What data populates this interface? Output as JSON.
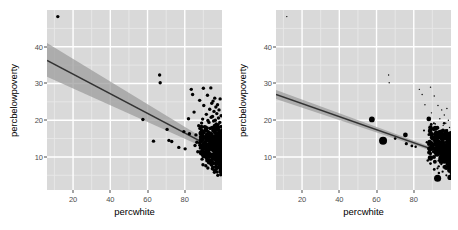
{
  "figure": {
    "type": "faceted-scatter",
    "panel_bg": "#d9d9d9",
    "grid_major_color": "#ffffff",
    "grid_minor_color": "#e8e8e8",
    "point_color": "#000000",
    "line_color": "#333333",
    "ribbon_color": "#9a9a9a"
  },
  "panels": {
    "left": {
      "xlabel": "percwhite",
      "ylabel": "percbelowpoverty",
      "xticks": [
        20,
        40,
        60,
        80
      ],
      "yticks": [
        10,
        20,
        30,
        40
      ]
    },
    "right": {
      "xlabel": "percwhite",
      "ylabel": "percbelowpoverty",
      "xticks": [
        20,
        40,
        60,
        80
      ],
      "yticks": [
        10,
        20,
        30,
        40
      ]
    }
  },
  "legend": {
    "title": "popdensity",
    "entries": [
      {
        "label": "20000",
        "size": 3.2
      },
      {
        "label": "40000",
        "size": 4.6
      },
      {
        "label": "60000",
        "size": 6.2
      },
      {
        "label": "80000",
        "size": 8.0
      }
    ]
  },
  "chart_data": {
    "type": "scatter",
    "title": "",
    "xlabel": "percwhite",
    "ylabel": "percbelowpoverty",
    "xlim": [
      6,
      100
    ],
    "ylim": [
      1,
      50
    ],
    "xticks": [
      20,
      40,
      60,
      80
    ],
    "yticks": [
      10,
      20,
      30,
      40
    ],
    "grid": true,
    "legend": {
      "position": "right",
      "title": "popdensity",
      "values": [
        20000,
        40000,
        60000,
        80000
      ]
    },
    "panels": [
      {
        "name": "left",
        "size_mapping": false,
        "fit": {
          "type": "linear",
          "x0": 6,
          "y0": 36.3,
          "x1": 100,
          "y1": 11.2,
          "band_lo0": 31.8,
          "band_hi0": 41.0,
          "band_lo1": 10.4,
          "band_hi1": 12.0
        },
        "points": [
          [
            11.8,
            48.2
          ],
          [
            57.5,
            20.2
          ],
          [
            66.5,
            32.3
          ],
          [
            66.8,
            30.2
          ],
          [
            63.2,
            14.3
          ],
          [
            70.5,
            17.5
          ],
          [
            71.5,
            14.5
          ],
          [
            73.0,
            14.2
          ],
          [
            76.8,
            12.6
          ],
          [
            79.5,
            16.9
          ],
          [
            80.2,
            12.2
          ],
          [
            82.0,
            20.4
          ],
          [
            82.5,
            16.3
          ],
          [
            83.5,
            28.4
          ],
          [
            84.2,
            27.0
          ],
          [
            85.0,
            22.2
          ],
          [
            85.5,
            13.1
          ],
          [
            86.0,
            16.0
          ],
          [
            86.5,
            14.0
          ],
          [
            87.0,
            11.4
          ],
          [
            87.5,
            18.5
          ],
          [
            88.0,
            25.4
          ],
          [
            88.5,
            15.2
          ],
          [
            89.0,
            12.9
          ],
          [
            89.3,
            9.4
          ],
          [
            89.6,
            20.3
          ],
          [
            90.0,
            28.7
          ],
          [
            90.2,
            24.0
          ],
          [
            90.6,
            18.2
          ],
          [
            90.8,
            13.7
          ],
          [
            91.0,
            10.1
          ],
          [
            91.3,
            7.6
          ],
          [
            91.6,
            21.6
          ],
          [
            91.9,
            17.0
          ],
          [
            92.0,
            12.4
          ],
          [
            92.2,
            26.8
          ],
          [
            92.4,
            15.0
          ],
          [
            92.6,
            11.0
          ],
          [
            92.8,
            8.4
          ],
          [
            93.0,
            19.4
          ],
          [
            93.2,
            14.6
          ],
          [
            93.4,
            23.0
          ],
          [
            93.6,
            10.4
          ],
          [
            93.8,
            17.8
          ],
          [
            94.0,
            28.8
          ],
          [
            94.1,
            13.2
          ],
          [
            94.2,
            20.8
          ],
          [
            94.3,
            9.0
          ],
          [
            94.4,
            16.2
          ],
          [
            94.5,
            24.6
          ],
          [
            94.6,
            12.0
          ],
          [
            94.7,
            18.0
          ],
          [
            94.8,
            6.8
          ],
          [
            94.9,
            21.0
          ],
          [
            95.0,
            14.2
          ],
          [
            95.1,
            10.8
          ],
          [
            95.2,
            25.2
          ],
          [
            95.3,
            17.4
          ],
          [
            95.4,
            13.0
          ],
          [
            95.5,
            19.8
          ],
          [
            95.6,
            8.2
          ],
          [
            95.7,
            22.4
          ],
          [
            95.8,
            15.6
          ],
          [
            95.9,
            11.6
          ],
          [
            96.0,
            18.6
          ],
          [
            96.1,
            26.0
          ],
          [
            96.2,
            9.8
          ],
          [
            96.3,
            14.8
          ],
          [
            96.4,
            20.0
          ],
          [
            96.5,
            12.2
          ],
          [
            96.6,
            16.6
          ],
          [
            96.7,
            23.6
          ],
          [
            96.8,
            7.4
          ],
          [
            96.9,
            19.0
          ],
          [
            97.0,
            13.6
          ],
          [
            97.1,
            10.2
          ],
          [
            97.2,
            21.8
          ],
          [
            97.3,
            15.0
          ],
          [
            97.4,
            17.6
          ],
          [
            97.5,
            11.8
          ],
          [
            97.6,
            24.2
          ],
          [
            97.7,
            8.8
          ],
          [
            97.8,
            14.0
          ],
          [
            97.9,
            18.8
          ],
          [
            98.0,
            12.6
          ],
          [
            98.1,
            20.6
          ],
          [
            98.2,
            16.0
          ],
          [
            98.3,
            9.4
          ],
          [
            98.4,
            22.8
          ],
          [
            98.5,
            13.4
          ],
          [
            98.6,
            17.2
          ],
          [
            98.7,
            11.0
          ],
          [
            98.8,
            19.4
          ],
          [
            98.9,
            15.4
          ],
          [
            99.0,
            25.8
          ],
          [
            99.1,
            10.6
          ],
          [
            99.2,
            14.4
          ],
          [
            99.3,
            18.2
          ],
          [
            99.4,
            12.0
          ],
          [
            99.5,
            21.2
          ],
          [
            99.6,
            16.8
          ],
          [
            99.7,
            8.0
          ],
          [
            99.8,
            13.8
          ],
          [
            99.9,
            5.4
          ]
        ]
      },
      {
        "name": "right",
        "size_mapping": true,
        "size_field": "popdensity",
        "fit": {
          "type": "linear",
          "x0": 6,
          "y0": 27.0,
          "x1": 100,
          "y1": 10.3,
          "band_lo0": 25.8,
          "band_hi0": 28.2,
          "band_lo1": 9.9,
          "band_hi1": 10.7
        },
        "points": [
          [
            11.8,
            48.2,
            900
          ],
          [
            57.5,
            20.2,
            55000
          ],
          [
            63.5,
            14.4,
            80000
          ],
          [
            66.5,
            32.3,
            1200
          ],
          [
            66.8,
            30.2,
            1200
          ],
          [
            75.5,
            16.0,
            42000
          ],
          [
            70.0,
            15.0,
            14000
          ],
          [
            76.0,
            13.6,
            20000
          ],
          [
            79.0,
            13.0,
            16000
          ],
          [
            81.0,
            12.8,
            12000
          ],
          [
            83.0,
            28.4,
            2000
          ],
          [
            84.5,
            27.0,
            2000
          ],
          [
            86.0,
            24.2,
            2500
          ],
          [
            85.5,
            17.2,
            9000
          ],
          [
            87.0,
            14.0,
            11000
          ],
          [
            88.0,
            12.2,
            13000
          ],
          [
            89.0,
            29.0,
            1500
          ],
          [
            89.5,
            22.0,
            3000
          ],
          [
            90.0,
            16.4,
            8000
          ],
          [
            90.5,
            12.0,
            9000
          ],
          [
            91.0,
            26.6,
            1800
          ],
          [
            91.5,
            19.0,
            5000
          ],
          [
            92.0,
            13.8,
            7000
          ],
          [
            92.5,
            10.6,
            6000
          ],
          [
            93.0,
            24.0,
            2200
          ],
          [
            93.3,
            17.8,
            4500
          ],
          [
            93.6,
            12.6,
            6500
          ],
          [
            94.0,
            20.4,
            3500
          ],
          [
            94.2,
            15.2,
            5500
          ],
          [
            94.5,
            11.2,
            5000
          ],
          [
            94.8,
            8.0,
            9000
          ],
          [
            95.0,
            22.8,
            2600
          ],
          [
            95.2,
            16.0,
            4200
          ],
          [
            95.4,
            13.0,
            4800
          ],
          [
            95.6,
            9.2,
            7000
          ],
          [
            95.8,
            18.6,
            3300
          ],
          [
            96.0,
            14.4,
            4000
          ],
          [
            96.2,
            11.0,
            4400
          ],
          [
            96.4,
            21.4,
            2400
          ],
          [
            96.6,
            16.8,
            3600
          ],
          [
            96.8,
            12.8,
            3900
          ],
          [
            97.0,
            9.6,
            5200
          ],
          [
            97.2,
            19.2,
            2800
          ],
          [
            97.4,
            15.0,
            3400
          ],
          [
            97.6,
            11.6,
            3600
          ],
          [
            97.8,
            23.2,
            2000
          ],
          [
            98.0,
            17.4,
            3000
          ],
          [
            98.2,
            13.4,
            3200
          ],
          [
            98.4,
            10.2,
            3800
          ],
          [
            98.6,
            20.0,
            2400
          ],
          [
            98.8,
            15.6,
            2800
          ],
          [
            99.0,
            12.2,
            3000
          ],
          [
            99.2,
            18.0,
            2200
          ],
          [
            99.4,
            14.0,
            2600
          ],
          [
            99.6,
            10.8,
            2800
          ],
          [
            99.8,
            16.2,
            2000
          ],
          [
            92.8,
            4.2,
            70000
          ],
          [
            91.0,
            6.6,
            16000
          ],
          [
            93.5,
            5.6,
            12000
          ],
          [
            95.5,
            6.0,
            10000
          ],
          [
            97.5,
            5.0,
            9000
          ],
          [
            89.0,
            8.2,
            14000
          ],
          [
            87.5,
            9.0,
            12000
          ]
        ]
      }
    ]
  }
}
